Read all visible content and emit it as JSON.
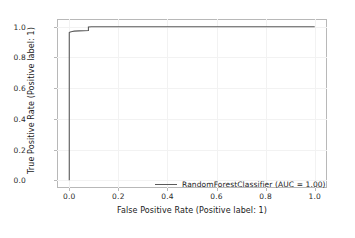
{
  "chart_data": {
    "type": "line",
    "title": "",
    "xlabel": "False Positive Rate (Positive label: 1)",
    "ylabel": "True Positive Rate (Positive label: 1)",
    "xlim": [
      -0.05,
      1.05
    ],
    "ylim": [
      -0.05,
      1.05
    ],
    "xticks": [
      0.0,
      0.2,
      0.4,
      0.6,
      0.8,
      1.0
    ],
    "yticks": [
      0.0,
      0.2,
      0.4,
      0.6,
      0.8,
      1.0
    ],
    "xticklabels": [
      "0.0",
      "0.2",
      "0.4",
      "0.6",
      "0.8",
      "1.0"
    ],
    "yticklabels": [
      "0.0",
      "0.2",
      "0.4",
      "0.6",
      "0.8",
      "1.0"
    ],
    "grid": true,
    "legend_position": "lower right",
    "series": [
      {
        "name": "RandomForestClassifier (AUC = 1.00)",
        "color": "#5a5a5a",
        "auc": 1.0,
        "x": [
          0.0,
          0.0,
          0.004,
          0.012,
          0.02,
          0.04,
          0.078,
          0.078,
          0.09,
          0.2,
          0.4,
          0.6,
          0.8,
          1.0
        ],
        "y": [
          0.0,
          0.962,
          0.966,
          0.969,
          0.971,
          0.973,
          0.975,
          0.998,
          1.0,
          1.0,
          1.0,
          1.0,
          1.0,
          1.0
        ]
      }
    ]
  },
  "legend": {
    "entries": [
      {
        "label": "RandomForestClassifier (AUC = 1.00)"
      }
    ]
  }
}
